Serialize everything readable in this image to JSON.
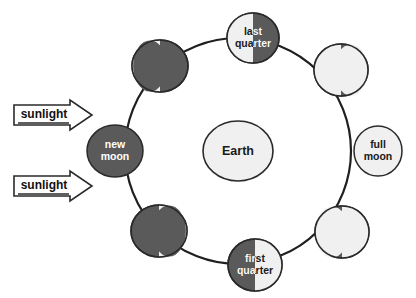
{
  "diagram": {
    "background_color": "#ffffff",
    "colors": {
      "dark_side": "#5a5a5a",
      "lit_side": "#f0f0f0",
      "outline": "#2a2a2a",
      "orbit_line": "#1f1f1f",
      "dark_text": "#1a1a1a",
      "light_text": "#ffffff"
    },
    "center_body": {
      "label": "Earth",
      "cx": 238,
      "cy": 151,
      "rx": 35,
      "ry": 30
    },
    "orbit": {
      "cx": 238,
      "cy": 151,
      "r": 113,
      "stroke_width": 2.2
    },
    "sunlight_arrows": [
      {
        "label": "sunlight",
        "x": 14,
        "y": 100
      },
      {
        "label": "sunlight",
        "x": 14,
        "y": 171
      }
    ],
    "moons": [
      {
        "name": "last-quarter",
        "label_lines": [
          "last",
          "quarter"
        ],
        "angle_deg": 270,
        "cx": 253,
        "cy": 38,
        "rx": 26,
        "ry": 25,
        "phase": "half-lit-left",
        "lit_fraction": 0.5,
        "lit_side": "left",
        "labelled": true
      },
      {
        "name": "waning-gibbous",
        "label_lines": [],
        "angle_deg": 315,
        "cx": 341,
        "cy": 70,
        "rx": 27,
        "ry": 26,
        "phase": "gibbous-lit-left",
        "lit_fraction": 0.75,
        "lit_side": "left",
        "labelled": false
      },
      {
        "name": "full-moon",
        "label_lines": [
          "full",
          "moon"
        ],
        "angle_deg": 0,
        "cx": 378,
        "cy": 151,
        "rx": 24,
        "ry": 25,
        "phase": "full",
        "lit_fraction": 1,
        "lit_side": "all",
        "labelled": true
      },
      {
        "name": "waxing-gibbous",
        "label_lines": [],
        "angle_deg": 45,
        "cx": 342,
        "cy": 232,
        "rx": 27,
        "ry": 26,
        "phase": "gibbous-lit-right",
        "lit_fraction": 0.75,
        "lit_side": "right",
        "labelled": false
      },
      {
        "name": "first-quarter",
        "label_lines": [
          "first",
          "quarter"
        ],
        "angle_deg": 90,
        "cx": 255,
        "cy": 265,
        "rx": 27,
        "ry": 26,
        "phase": "half-lit-right",
        "lit_fraction": 0.5,
        "lit_side": "right",
        "labelled": true
      },
      {
        "name": "waxing-crescent",
        "label_lines": [],
        "angle_deg": 135,
        "cx": 159,
        "cy": 231,
        "rx": 28,
        "ry": 26,
        "phase": "crescent-lit-right",
        "lit_fraction": 0.25,
        "lit_side": "right",
        "labelled": false
      },
      {
        "name": "new-moon",
        "label_lines": [
          "new",
          "moon"
        ],
        "angle_deg": 180,
        "cx": 115,
        "cy": 151,
        "rx": 28,
        "ry": 26,
        "phase": "new",
        "lit_fraction": 0,
        "lit_side": "none",
        "labelled": true
      },
      {
        "name": "waning-crescent",
        "label_lines": [],
        "angle_deg": 225,
        "cx": 160,
        "cy": 66,
        "rx": 28,
        "ry": 26,
        "phase": "crescent-lit-left",
        "lit_fraction": 0.25,
        "lit_side": "left",
        "labelled": false
      }
    ]
  }
}
